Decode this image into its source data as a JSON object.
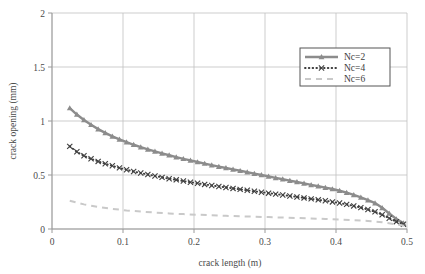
{
  "chart_data": {
    "type": "line",
    "title": "",
    "xlabel": "crack length (m)",
    "ylabel": "crack opening (mm)",
    "xlim": [
      0,
      0.5
    ],
    "ylim": [
      0,
      2
    ],
    "xticks": [
      "0",
      "0.1",
      "0.2",
      "0.3",
      "0.4",
      "0.5"
    ],
    "xtick_values": [
      0,
      0.1,
      0.2,
      0.3,
      0.4,
      0.5
    ],
    "yticks": [
      "0",
      "0.5",
      "1",
      "1.5",
      "2"
    ],
    "ytick_values": [
      0,
      0.5,
      1,
      1.5,
      2
    ],
    "grid": true,
    "legend_position": "upper-right",
    "series": [
      {
        "name": "Nc=2",
        "color": "#8c8c8c",
        "marker": "triangle",
        "linestyle": "solid",
        "x": [
          0.025,
          0.035,
          0.045,
          0.055,
          0.065,
          0.075,
          0.085,
          0.095,
          0.105,
          0.115,
          0.125,
          0.135,
          0.145,
          0.155,
          0.165,
          0.175,
          0.185,
          0.195,
          0.205,
          0.215,
          0.225,
          0.235,
          0.245,
          0.255,
          0.265,
          0.275,
          0.285,
          0.295,
          0.305,
          0.315,
          0.325,
          0.335,
          0.345,
          0.355,
          0.365,
          0.375,
          0.385,
          0.395,
          0.405,
          0.415,
          0.425,
          0.435,
          0.445,
          0.455,
          0.465,
          0.475,
          0.485,
          0.495
        ],
        "y": [
          1.12,
          1.06,
          1.01,
          0.965,
          0.925,
          0.89,
          0.858,
          0.83,
          0.804,
          0.78,
          0.758,
          0.737,
          0.718,
          0.7,
          0.683,
          0.666,
          0.65,
          0.635,
          0.62,
          0.606,
          0.592,
          0.578,
          0.565,
          0.552,
          0.539,
          0.526,
          0.513,
          0.5,
          0.487,
          0.474,
          0.461,
          0.448,
          0.435,
          0.422,
          0.409,
          0.396,
          0.383,
          0.37,
          0.354,
          0.336,
          0.316,
          0.293,
          0.268,
          0.24,
          0.196,
          0.144,
          0.092,
          0.055
        ]
      },
      {
        "name": "Nc=4",
        "color": "#3f3f3f",
        "marker": "x",
        "linestyle": "dotted",
        "x": [
          0.025,
          0.035,
          0.045,
          0.055,
          0.065,
          0.075,
          0.085,
          0.095,
          0.105,
          0.115,
          0.125,
          0.135,
          0.145,
          0.155,
          0.165,
          0.175,
          0.185,
          0.195,
          0.205,
          0.215,
          0.225,
          0.235,
          0.245,
          0.255,
          0.265,
          0.275,
          0.285,
          0.295,
          0.305,
          0.315,
          0.325,
          0.335,
          0.345,
          0.355,
          0.365,
          0.375,
          0.385,
          0.395,
          0.405,
          0.415,
          0.425,
          0.435,
          0.445,
          0.455,
          0.465,
          0.475,
          0.485,
          0.495
        ],
        "y": [
          0.765,
          0.715,
          0.678,
          0.65,
          0.626,
          0.604,
          0.585,
          0.566,
          0.549,
          0.533,
          0.518,
          0.504,
          0.491,
          0.478,
          0.466,
          0.455,
          0.444,
          0.433,
          0.423,
          0.413,
          0.403,
          0.394,
          0.385,
          0.376,
          0.367,
          0.358,
          0.349,
          0.341,
          0.332,
          0.323,
          0.315,
          0.306,
          0.297,
          0.288,
          0.279,
          0.27,
          0.261,
          0.251,
          0.24,
          0.228,
          0.214,
          0.198,
          0.18,
          0.159,
          0.132,
          0.1,
          0.068,
          0.045
        ]
      },
      {
        "name": "Nc=6",
        "color": "#c9c9c9",
        "marker": "none",
        "linestyle": "dashed",
        "x": [
          0.025,
          0.045,
          0.065,
          0.085,
          0.105,
          0.125,
          0.145,
          0.165,
          0.185,
          0.205,
          0.225,
          0.245,
          0.265,
          0.285,
          0.305,
          0.325,
          0.345,
          0.365,
          0.385,
          0.405,
          0.425,
          0.445,
          0.465,
          0.485,
          0.497
        ],
        "y": [
          0.262,
          0.228,
          0.204,
          0.186,
          0.172,
          0.161,
          0.152,
          0.144,
          0.138,
          0.132,
          0.127,
          0.122,
          0.118,
          0.114,
          0.11,
          0.106,
          0.102,
          0.098,
          0.093,
          0.088,
          0.082,
          0.074,
          0.063,
          0.043,
          0.028
        ]
      }
    ]
  },
  "legend": {
    "entries": [
      {
        "label": "Nc=2"
      },
      {
        "label": "Nc=4"
      },
      {
        "label": "Nc=6"
      }
    ]
  },
  "colors": {
    "series1": "#8c8c8c",
    "series2": "#3f3f3f",
    "series3": "#c9c9c9",
    "grid": "#c0c0c0",
    "axis": "#9a9a9a",
    "text": "#4a4a4a"
  }
}
